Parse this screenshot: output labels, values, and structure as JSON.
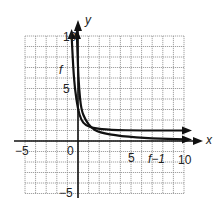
{
  "chart_data": {
    "type": "line",
    "title": "",
    "xlabel": "x",
    "ylabel": "y",
    "xlim": [
      -5,
      10
    ],
    "ylim": [
      -5,
      10
    ],
    "grid": true,
    "x_ticks": [
      "-5",
      "0",
      "5",
      "10"
    ],
    "y_ticks": [
      "10",
      "5",
      "-5"
    ],
    "series": [
      {
        "name": "f",
        "label": "f",
        "description": "Curve descending steeply from top near the y-axis, approaching y ≈ 1 asymptotically to the right",
        "points": [
          [
            -0.6,
            10
          ],
          [
            -0.45,
            7
          ],
          [
            -0.3,
            5
          ],
          [
            0,
            3
          ],
          [
            0.3,
            2
          ],
          [
            0.7,
            1.5
          ],
          [
            1.5,
            1.2
          ],
          [
            3,
            1.05
          ],
          [
            6,
            1.0
          ],
          [
            10,
            1.0
          ]
        ]
      },
      {
        "name": "f-inverse",
        "label": "f−1",
        "description": "Inverse of f, reflection across y = x; descends from top near x ≈ 1 and approaches y ≈ 0 to the right",
        "points": [
          [
            -0.1,
            10
          ],
          [
            0.0,
            7
          ],
          [
            0.1,
            5
          ],
          [
            0.3,
            3
          ],
          [
            0.7,
            2
          ],
          [
            1.2,
            1.3
          ],
          [
            2,
            0.8
          ],
          [
            4,
            0.45
          ],
          [
            7,
            0.25
          ],
          [
            10,
            0.15
          ]
        ]
      }
    ],
    "annotations": [
      {
        "text": "f",
        "x": -1.1,
        "y": 6.5
      },
      {
        "text": "f−1",
        "x": 6.8,
        "y": -0.6
      }
    ]
  },
  "labels": {
    "x_axis": "x",
    "y_axis": "y",
    "tick_neg5_x": "−5",
    "tick_0": "0",
    "tick_5_x": "5",
    "tick_10_x": "10",
    "tick_10_y": "10",
    "tick_5_y": "5",
    "tick_neg5_y": "−5",
    "curve_f": "f",
    "curve_f_inv": "f−1"
  }
}
